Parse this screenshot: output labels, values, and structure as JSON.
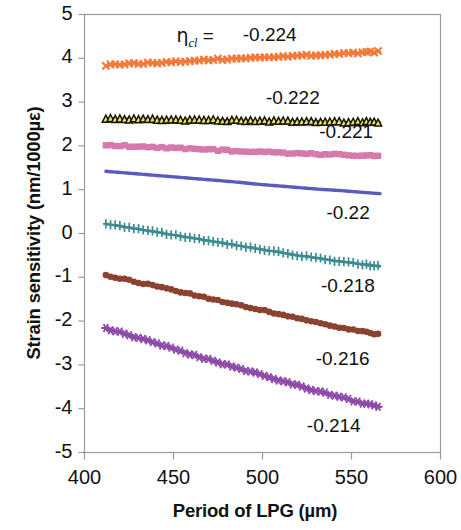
{
  "chart_data": {
    "type": "line",
    "title": "",
    "xlabel": "Period of LPG (µm)",
    "ylabel": "Strain sensitivity (nm/1000µε)",
    "xlim": [
      400,
      600
    ],
    "ylim": [
      -5,
      5
    ],
    "xticks": [
      400,
      450,
      500,
      550,
      600
    ],
    "yticks": [
      5,
      4,
      3,
      2,
      1,
      0,
      -1,
      -2,
      -3,
      -4,
      -5
    ],
    "xtick_labels": [
      "400",
      "450",
      "500",
      "550",
      "600"
    ],
    "ytick_labels": [
      "5",
      "4",
      "3",
      "2",
      "1",
      "0",
      "-1",
      "-2",
      "-3",
      "-4",
      "-5"
    ],
    "grid": false,
    "legend": "inline-annotations",
    "parameter_symbol": "η",
    "parameter_subscript": "cl",
    "parameter_prefix_label": "ηcl =",
    "x_data_range": [
      412,
      566
    ],
    "series": [
      {
        "name": "-0.224",
        "label": "-0.224",
        "color": "#F4793B",
        "marker": "x",
        "x": [
          412,
          424,
          436,
          448,
          460,
          472,
          484,
          496,
          508,
          520,
          532,
          544,
          556,
          566
        ],
        "values": [
          3.84,
          3.87,
          3.89,
          3.92,
          3.94,
          3.97,
          3.99,
          4.01,
          4.03,
          4.06,
          4.08,
          4.1,
          4.13,
          4.15
        ],
        "annotation": {
          "x": 508,
          "y": 4.5
        }
      },
      {
        "name": "-0.222",
        "label": "-0.222",
        "color": "#171506",
        "marker": "triangle",
        "x": [
          412,
          424,
          436,
          448,
          460,
          472,
          484,
          496,
          508,
          520,
          532,
          544,
          556,
          566
        ],
        "values": [
          2.62,
          2.61,
          2.6,
          2.59,
          2.58,
          2.58,
          2.57,
          2.56,
          2.56,
          2.55,
          2.55,
          2.54,
          2.54,
          2.53
        ],
        "annotation": {
          "x": 521,
          "y": 3.08
        }
      },
      {
        "name": "-0.221",
        "label": "-0.221",
        "color": "#D679AC",
        "marker": "square",
        "x": [
          412,
          424,
          436,
          448,
          460,
          472,
          484,
          496,
          508,
          520,
          532,
          544,
          556,
          566
        ],
        "values": [
          2.02,
          2.0,
          1.97,
          1.95,
          1.93,
          1.91,
          1.89,
          1.87,
          1.85,
          1.83,
          1.81,
          1.8,
          1.78,
          1.77
        ],
        "annotation": {
          "x": 551,
          "y": 2.29
        }
      },
      {
        "name": "-0.22",
        "label": "-0.22",
        "color": "#5B5BBE",
        "marker": "line",
        "x": [
          412,
          424,
          436,
          448,
          460,
          472,
          484,
          496,
          508,
          520,
          532,
          544,
          556,
          566
        ],
        "values": [
          1.42,
          1.38,
          1.34,
          1.3,
          1.26,
          1.22,
          1.18,
          1.13,
          1.09,
          1.05,
          1.01,
          0.98,
          0.94,
          0.91
        ],
        "annotation": {
          "x": 555,
          "y": 0.45
        }
      },
      {
        "name": "-0.218",
        "label": "-0.218",
        "color": "#3A8C92",
        "marker": "plus",
        "x": [
          412,
          424,
          436,
          448,
          460,
          472,
          484,
          496,
          508,
          520,
          532,
          544,
          556,
          566
        ],
        "values": [
          0.22,
          0.14,
          0.06,
          -0.02,
          -0.1,
          -0.18,
          -0.26,
          -0.34,
          -0.42,
          -0.5,
          -0.57,
          -0.64,
          -0.7,
          -0.75
        ],
        "annotation": {
          "x": 552,
          "y": -1.22
        }
      },
      {
        "name": "-0.216",
        "label": "-0.216",
        "color": "#8A4231",
        "marker": "circle",
        "x": [
          412,
          424,
          436,
          448,
          460,
          472,
          484,
          496,
          508,
          520,
          532,
          544,
          556,
          566
        ],
        "values": [
          -0.95,
          -1.06,
          -1.17,
          -1.28,
          -1.39,
          -1.5,
          -1.61,
          -1.72,
          -1.83,
          -1.94,
          -2.05,
          -2.15,
          -2.24,
          -2.31
        ],
        "annotation": {
          "x": 549,
          "y": -2.88
        }
      },
      {
        "name": "-0.214",
        "label": "-0.214",
        "color": "#8E4AA8",
        "marker": "star",
        "x": [
          412,
          424,
          436,
          448,
          460,
          472,
          484,
          496,
          508,
          520,
          532,
          544,
          556,
          566
        ],
        "values": [
          -2.16,
          -2.31,
          -2.46,
          -2.61,
          -2.76,
          -2.9,
          -3.05,
          -3.19,
          -3.33,
          -3.47,
          -3.61,
          -3.74,
          -3.87,
          -3.96
        ],
        "annotation": {
          "x": 544,
          "y": -4.42
        }
      }
    ]
  }
}
